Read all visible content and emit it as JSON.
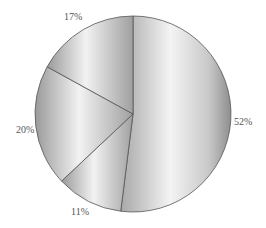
{
  "chart_data": {
    "type": "pie",
    "title": "",
    "start_angle_deg": 0,
    "direction": "clockwise",
    "categories": [
      "A",
      "B",
      "C",
      "D"
    ],
    "values": [
      52,
      11,
      20,
      17
    ],
    "labels": [
      "52%",
      "11%",
      "20%",
      "17%"
    ],
    "legend": null,
    "colors": {
      "fill_dark": "#9a9a9a",
      "fill_light": "#f2f2f2",
      "edge": "#555555",
      "label": "#555555"
    }
  },
  "labels": {
    "s52": "52%",
    "s11": "11%",
    "s20": "20%",
    "s17": "17%"
  }
}
